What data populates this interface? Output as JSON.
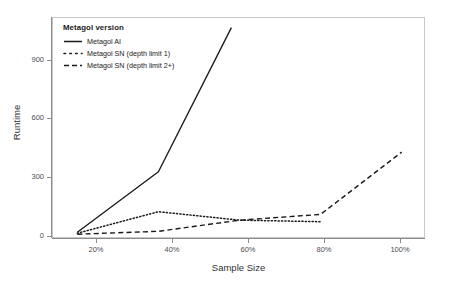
{
  "chart_data": {
    "type": "line",
    "title": "",
    "xlabel": "Sample Size",
    "ylabel": "Runtime",
    "x": [
      20,
      40,
      60,
      80,
      100
    ],
    "xticklabels": [
      "20%",
      "40%",
      "60%",
      "80%",
      "100%"
    ],
    "yticklabels": [
      "0",
      "300",
      "600",
      "900"
    ],
    "ytickvalues": [
      0,
      300,
      600,
      900
    ],
    "xlim": [
      14,
      106
    ],
    "ylim": [
      -20,
      1130
    ],
    "grid": false,
    "legend_position": "top-left",
    "legend_title": "Metagol version",
    "series": [
      {
        "name": "Metagol AI",
        "linestyle": "solid",
        "color": "#1a1a1a",
        "x": [
          20,
          40,
          58
        ],
        "values": [
          15,
          330,
          1080
        ],
        "clipped_at_top": true
      },
      {
        "name": "Metagol SN (depth limit 1)",
        "linestyle": "dotted",
        "color": "#1a1a1a",
        "x": [
          20,
          40,
          60,
          80
        ],
        "values": [
          10,
          122,
          78,
          70
        ]
      },
      {
        "name": "Metagol SN (depth limit 2+)",
        "linestyle": "dashed",
        "color": "#1a1a1a",
        "x": [
          20,
          40,
          60,
          80,
          100
        ],
        "values": [
          5,
          20,
          78,
          108,
          432
        ]
      }
    ]
  },
  "axes": {
    "x_title": "Sample Size",
    "y_title": "Runtime",
    "x_ticks": [
      {
        "label": "20%"
      },
      {
        "label": "40%"
      },
      {
        "label": "60%"
      },
      {
        "label": "80%"
      },
      {
        "label": "100%"
      }
    ],
    "y_ticks": [
      {
        "label": "900"
      },
      {
        "label": "600"
      },
      {
        "label": "300"
      },
      {
        "label": "0"
      }
    ]
  },
  "legend": {
    "title": "Metagol version",
    "items": [
      {
        "label": "Metagol AI",
        "style": "solid"
      },
      {
        "label": "Metagol SN (depth limit 1)",
        "style": "dotted"
      },
      {
        "label": "Metagol SN (depth limit 2+)",
        "style": "dashed"
      }
    ]
  },
  "colors": {
    "line": "#1a1a1a",
    "panel_border": "#c8c8c8",
    "axis": "#8c8c8c",
    "text": "#4d4d4d",
    "background": "#ffffff"
  }
}
